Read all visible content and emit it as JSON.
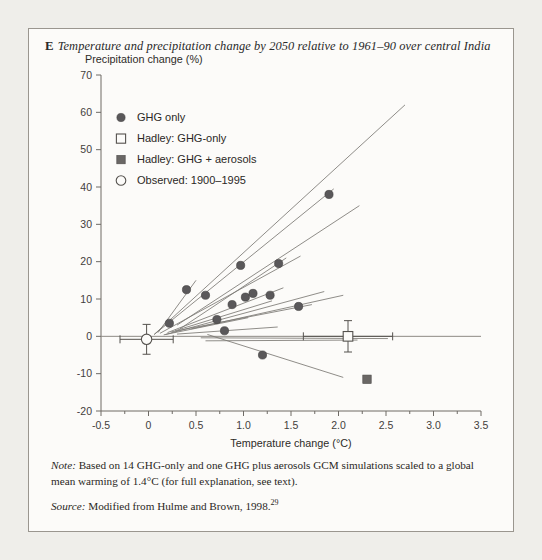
{
  "figure": {
    "panel_letter": "E",
    "title": "Temperature and precipitation change by 2050 relative to 1961–90 over central India",
    "note_label": "Note:",
    "note_text": " Based on 14 GHG-only and one GHG plus aerosols GCM simulations scaled to a global mean warming of 1.4°C (for full explanation, see text).",
    "source_label": "Source:",
    "source_text": " Modified from Hulme and Brown, 1998.",
    "source_superscript": "29"
  },
  "chart_data": {
    "type": "scatter",
    "title": "Temperature and precipitation change by 2050 relative to 1961–90 over central India",
    "xlabel": "Temperature change (°C)",
    "ylabel": "Precipitation change (%)",
    "xlim": [
      -0.5,
      3.5
    ],
    "ylim": [
      -20,
      70
    ],
    "xticks": [
      -0.5,
      0,
      0.5,
      1.0,
      1.5,
      2.0,
      2.5,
      3.0,
      3.5
    ],
    "xticklabels": [
      "-0.5",
      "0",
      "0.5",
      "1.0",
      "1.5",
      "2.0",
      "2.5",
      "3.0",
      "3.5"
    ],
    "yticks": [
      -20,
      -10,
      0,
      10,
      20,
      30,
      40,
      50,
      60,
      70
    ],
    "yticklabels": [
      "-20",
      "-10",
      "0",
      "10",
      "20",
      "30",
      "40",
      "50",
      "60",
      "70"
    ],
    "grid": false,
    "legend_position": "upper-left",
    "legend": [
      {
        "label": "GHG only",
        "marker": "filled-circle"
      },
      {
        "label": "Hadley: GHG-only",
        "marker": "open-square"
      },
      {
        "label": "Hadley: GHG + aerosols",
        "marker": "filled-square"
      },
      {
        "label": "Observed: 1900–1995",
        "marker": "open-circle"
      }
    ],
    "series": [
      {
        "name": "GHG only",
        "marker": "filled-circle",
        "points": [
          {
            "x": 0.22,
            "y": 3.5
          },
          {
            "x": 0.4,
            "y": 12.5
          },
          {
            "x": 0.6,
            "y": 11.0
          },
          {
            "x": 0.72,
            "y": 4.5
          },
          {
            "x": 0.8,
            "y": 1.5
          },
          {
            "x": 0.88,
            "y": 8.5
          },
          {
            "x": 0.97,
            "y": 19.0
          },
          {
            "x": 1.02,
            "y": 10.5
          },
          {
            "x": 1.1,
            "y": 11.5
          },
          {
            "x": 1.2,
            "y": -5.0
          },
          {
            "x": 1.28,
            "y": 11.0
          },
          {
            "x": 1.37,
            "y": 19.5
          },
          {
            "x": 1.58,
            "y": 8.0
          },
          {
            "x": 1.9,
            "y": 38.0
          }
        ]
      },
      {
        "name": "Hadley: GHG-only",
        "marker": "open-square",
        "points": [
          {
            "x": 2.1,
            "y": 0.0,
            "xerr": 0.47,
            "yerr": 4.2
          }
        ]
      },
      {
        "name": "Hadley: GHG + aerosols",
        "marker": "filled-square",
        "points": [
          {
            "x": 2.3,
            "y": -11.5
          }
        ]
      },
      {
        "name": "Observed: 1900–1995",
        "marker": "open-circle",
        "points": [
          {
            "x": -0.02,
            "y": -0.8,
            "xerr": 0.28,
            "yerr": 4.0
          }
        ]
      }
    ],
    "scaling_lines": [
      {
        "x1": 0.06,
        "y1": 0.5,
        "x2": 2.7,
        "y2": 62.0
      },
      {
        "x1": 0.06,
        "y1": 0.5,
        "x2": 1.95,
        "y2": 39.5
      },
      {
        "x1": 0.1,
        "y1": 1.0,
        "x2": 0.5,
        "y2": 15.0
      },
      {
        "x1": 0.3,
        "y1": 3.0,
        "x2": 2.22,
        "y2": 35.0
      },
      {
        "x1": 0.33,
        "y1": 2.0,
        "x2": 1.45,
        "y2": 21.0
      },
      {
        "x1": 0.12,
        "y1": 0.8,
        "x2": 1.6,
        "y2": 21.5
      },
      {
        "x1": 0.2,
        "y1": 1.0,
        "x2": 1.42,
        "y2": 13.0
      },
      {
        "x1": 0.18,
        "y1": 0.5,
        "x2": 1.85,
        "y2": 12.0
      },
      {
        "x1": 0.45,
        "y1": 2.0,
        "x2": 2.05,
        "y2": 11.0
      },
      {
        "x1": 0.28,
        "y1": 1.5,
        "x2": 1.3,
        "y2": 9.5
      },
      {
        "x1": 0.24,
        "y1": 1.2,
        "x2": 1.72,
        "y2": 8.5
      },
      {
        "x1": 0.16,
        "y1": 0.4,
        "x2": 1.05,
        "y2": 5.0
      },
      {
        "x1": 0.3,
        "y1": 0.6,
        "x2": 1.36,
        "y2": 2.5
      },
      {
        "x1": 0.55,
        "y1": -0.4,
        "x2": 2.52,
        "y2": -0.6
      },
      {
        "x1": 0.6,
        "y1": -1.2,
        "x2": 2.2,
        "y2": -1.0
      },
      {
        "x1": 0.62,
        "y1": 0.5,
        "x2": 2.05,
        "y2": -11.0
      }
    ]
  }
}
